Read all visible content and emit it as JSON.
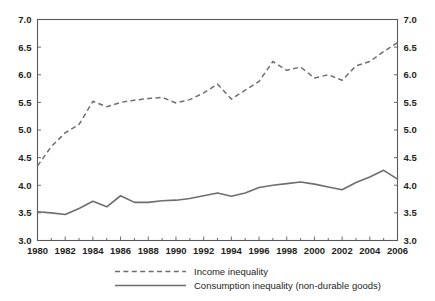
{
  "chart_data": {
    "type": "line",
    "title": "",
    "subtitle": "",
    "xlabel": "",
    "ylabel": "",
    "xlim": [
      1980,
      2006
    ],
    "ylim": [
      3.0,
      7.0
    ],
    "grid": false,
    "legend_position": "bottom",
    "dual_axis": true,
    "x": [
      1980,
      1981,
      1982,
      1983,
      1984,
      1985,
      1986,
      1987,
      1988,
      1989,
      1990,
      1991,
      1992,
      1993,
      1994,
      1995,
      1996,
      1997,
      1998,
      1999,
      2000,
      2001,
      2002,
      2003,
      2004,
      2005,
      2006
    ],
    "xticks": [
      1980,
      1982,
      1984,
      1986,
      1988,
      1990,
      1992,
      1994,
      1996,
      1998,
      2000,
      2002,
      2004,
      2006
    ],
    "xticklabels": [
      "1980",
      "1982",
      "1984",
      "1986",
      "1988",
      "1990",
      "1992",
      "1994",
      "1996",
      "1998",
      "2000",
      "2002",
      "2004",
      "2006"
    ],
    "xminorticks": [
      1981,
      1983,
      1985,
      1987,
      1989,
      1991,
      1993,
      1995,
      1997,
      1999,
      2001,
      2003,
      2005
    ],
    "yticks": [
      3.0,
      3.5,
      4.0,
      4.5,
      5.0,
      5.5,
      6.0,
      6.5,
      7.0
    ],
    "yticklabels_left": [
      "3.0",
      "3.5",
      "4.0",
      "4.5",
      "5.0",
      "5.5",
      "6.0",
      "6.5",
      "7.0"
    ],
    "yticklabels_right": [
      "3.0",
      "3.5",
      "4.0",
      "4.5",
      "5.0",
      "5.5",
      "6.0",
      "6.5",
      "7.0"
    ],
    "series": [
      {
        "name": "Income inequality",
        "style": "dashed",
        "color": "#6d6e71",
        "values": [
          4.35,
          4.7,
          4.95,
          5.1,
          5.52,
          5.42,
          5.5,
          5.54,
          5.57,
          5.59,
          5.49,
          5.55,
          5.67,
          5.83,
          5.56,
          5.72,
          5.88,
          6.24,
          6.08,
          6.14,
          5.94,
          6.0,
          5.9,
          6.16,
          6.24,
          6.42,
          6.58
        ]
      },
      {
        "name": "Consumption inequality (non-durable goods)",
        "style": "solid",
        "color": "#6d6e71",
        "values": [
          3.52,
          3.5,
          3.47,
          3.58,
          3.71,
          3.61,
          3.81,
          3.69,
          3.69,
          3.72,
          3.73,
          3.76,
          3.81,
          3.86,
          3.8,
          3.86,
          3.96,
          4.0,
          4.03,
          4.06,
          4.02,
          3.97,
          3.92,
          4.05,
          4.15,
          4.27,
          4.11
        ]
      }
    ],
    "legend": [
      {
        "label": "Income inequality",
        "style": "dashed"
      },
      {
        "label": "Consumption inequality (non-durable goods)",
        "style": "solid"
      }
    ],
    "colors": {
      "line": "#6d6e71",
      "axis": "#58595b",
      "text": "#231f20",
      "background": "#ffffff"
    }
  }
}
